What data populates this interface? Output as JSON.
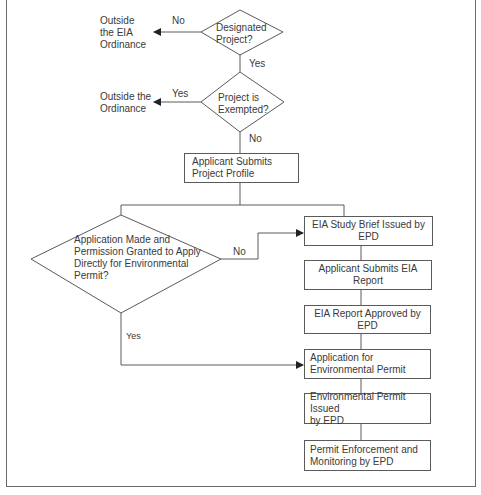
{
  "diagram": {
    "type": "flowchart",
    "colors": {
      "line": "#5a5a5a",
      "text": "#3a3a3a",
      "background": "#ffffff"
    },
    "decisions": [
      {
        "id": "d1",
        "text": "Designated\nProject?"
      },
      {
        "id": "d2",
        "text": "Project is\nExempted?"
      },
      {
        "id": "d3",
        "text": "Application Made and\nPermission Granted to Apply\nDirectly for Environmental\nPermit?"
      }
    ],
    "terminals": [
      {
        "id": "t1",
        "text": "Outside\nthe EIA\nOrdinance"
      },
      {
        "id": "t2",
        "text": "Outside the\nOrdinance"
      }
    ],
    "process_boxes": [
      {
        "id": "p0",
        "text": "Applicant Submits\nProject Profile"
      },
      {
        "id": "p1",
        "text": "EIA Study Brief Issued by EPD"
      },
      {
        "id": "p2",
        "text": "Applicant Submits EIA Report"
      },
      {
        "id": "p3",
        "text": "EIA Report Approved by EPD"
      },
      {
        "id": "p4",
        "text": "Application for\nEnvironmental Permit"
      },
      {
        "id": "p5",
        "text": "Environmental Permit Issued\nby EPD"
      },
      {
        "id": "p6",
        "text": "Permit Enforcement and\nMonitoring by EPD"
      }
    ],
    "edge_labels": {
      "d1_no": "No",
      "d1_yes": "Yes",
      "d2_yes": "Yes",
      "d2_no": "No",
      "d3_no": "No",
      "d3_yes": "Yes"
    },
    "edges": [
      {
        "from": "d1",
        "to": "t1",
        "label": "No"
      },
      {
        "from": "d1",
        "to": "d2",
        "label": "Yes"
      },
      {
        "from": "d2",
        "to": "t2",
        "label": "Yes"
      },
      {
        "from": "d2",
        "to": "p0",
        "label": "No"
      },
      {
        "from": "p0",
        "to": "d3",
        "label": ""
      },
      {
        "from": "p0",
        "to": "p1",
        "label": ""
      },
      {
        "from": "d3",
        "to": "p1",
        "label": "No"
      },
      {
        "from": "d3",
        "to": "p4",
        "label": "Yes"
      },
      {
        "from": "p1",
        "to": "p2",
        "label": ""
      },
      {
        "from": "p2",
        "to": "p3",
        "label": ""
      },
      {
        "from": "p3",
        "to": "p4",
        "label": ""
      },
      {
        "from": "p4",
        "to": "p5",
        "label": ""
      },
      {
        "from": "p5",
        "to": "p6",
        "label": ""
      }
    ]
  }
}
